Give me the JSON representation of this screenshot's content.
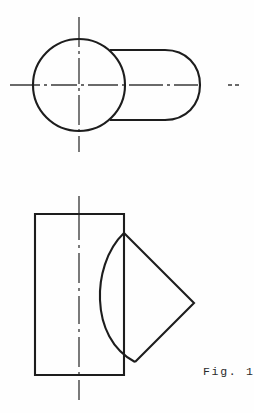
{
  "sheet": {
    "title": "Fig. 1",
    "background_color": "#fefefe",
    "width": 254,
    "height": 413,
    "line_color": "#1d1d1d",
    "centerline_color": "#3a3a3a"
  },
  "caption": {
    "label": "Fig. 1",
    "x": 203,
    "y": 375
  },
  "views": [
    {
      "name": "front-view",
      "description": "Circle with stadium-shaped cylinder body",
      "elements": {
        "circle": {
          "center_x": 79,
          "center_y": 85,
          "radius": 46
        },
        "body": {
          "left_x": 110,
          "right_x": 200,
          "top_y": 50,
          "bottom_y": 120,
          "cap_radius": 35
        },
        "horizontal_centerline": {
          "x1": 10,
          "x2": 243,
          "y": 85
        },
        "vertical_centerline": {
          "x": 79,
          "y1": 17,
          "y2": 152
        }
      }
    },
    {
      "name": "side-view",
      "description": "Rectangle with angled 45 degree branch and curved intersection",
      "elements": {
        "rectangle": {
          "left_x": 35,
          "right_x": 124,
          "top_y": 214,
          "bottom_y": 375
        },
        "branch": {
          "top_vertex_x": 124,
          "top_vertex_y": 233,
          "right_vertex_x": 194,
          "right_vertex_y": 303,
          "bottom_vertex_x": 135,
          "bottom_vertex_y": 362,
          "arc_bulge_x": 100
        },
        "vertical_centerline": {
          "x": 79,
          "y1": 196,
          "y2": 400
        }
      }
    }
  ]
}
